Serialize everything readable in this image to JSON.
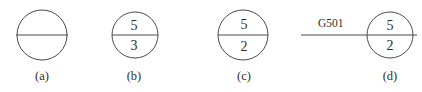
{
  "figure": {
    "background_color": "#ffffff",
    "stroke_color": "#4a4a4a",
    "text_color": "#2a2a2a",
    "items": [
      {
        "caption": "(a)",
        "top_value": "",
        "bottom_value": "",
        "wire_label": "",
        "has_wire": false
      },
      {
        "caption": "(b)",
        "top_value": "5",
        "bottom_value": "3",
        "wire_label": "",
        "has_wire": false
      },
      {
        "caption": "(c)",
        "top_value": "5",
        "bottom_value": "2",
        "wire_label": "",
        "has_wire": false
      },
      {
        "caption": "(d)",
        "top_value": "5",
        "bottom_value": "2",
        "wire_label": "G501",
        "has_wire": true
      }
    ]
  }
}
